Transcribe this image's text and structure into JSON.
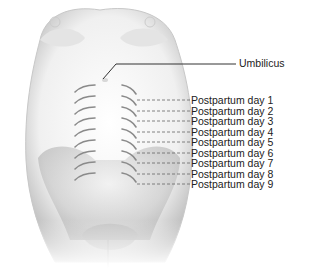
{
  "figure": {
    "umbilicus_label": "Umbilicus",
    "day_labels": [
      "Postpartum day 1",
      "Postpartum day 2",
      "Postpartum day 3",
      "Postpartum day 4",
      "Postpartum day 5",
      "Postpartum day 6",
      "Postpartum day 7",
      "Postpartum day 8",
      "Postpartum day 9"
    ]
  }
}
